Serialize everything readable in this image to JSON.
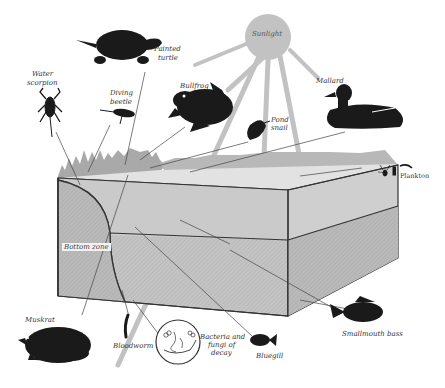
{
  "diagram": {
    "colors": {
      "block_top": "#e2e2e2",
      "block_upper": "#c9c9c9",
      "block_lower": "#bdbdbd",
      "sun": "#c2c2c2",
      "vegetation": "#a9a9a9",
      "silhouette": "#1a1a1a",
      "lines": "#333333"
    },
    "labels": {
      "sunlight": "Sunlight",
      "painted_turtle_1": "Painted",
      "painted_turtle_2": "turtle",
      "water_scorpion_1": "Water",
      "water_scorpion_2": "scorpion",
      "diving_beetle_1": "Diving",
      "diving_beetle_2": "beetle",
      "bullfrog": "Bullfrog",
      "mallard": "Mallard",
      "pond_snail_1": "Pond",
      "pond_snail_2": "snail",
      "plankton": "Plankton",
      "bottom_zone": "Bottom zone",
      "muskrat": "Muskrat",
      "bloodworm": "Bloodworm",
      "bacteria_1": "Bacteria and",
      "bacteria_2": "fungi of",
      "bacteria_3": "decay",
      "bluegill": "Bluegill",
      "smallmouth_bass": "Smallmouth bass"
    }
  }
}
